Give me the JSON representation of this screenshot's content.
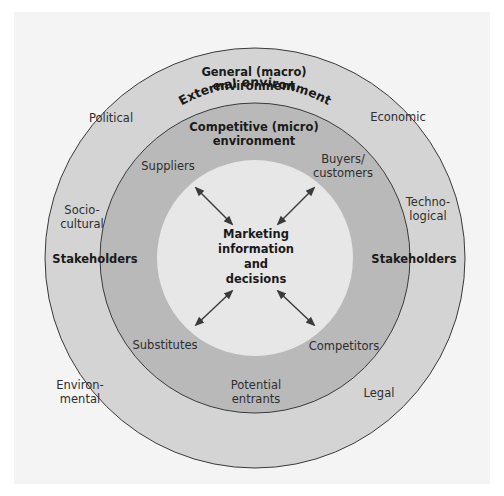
{
  "diagram": {
    "colors": {
      "background": "#ffffff",
      "panel": "#f4f4f4",
      "outer_ring": "#d4d4d4",
      "inner_ring": "#b9b9b9",
      "center": "#e7e7e7",
      "stroke": "#3a3a3a",
      "text": "#2e2e2e"
    },
    "outer_title": "External   environment",
    "general": {
      "title_line1": "General (macro)",
      "title_line2": "environment",
      "factors": {
        "political": "Political",
        "economic": "Economic",
        "socio_line1": "Socio-",
        "socio_line2": "cultural",
        "techno_line1": "Techno-",
        "techno_line2": "logical",
        "environ_line1": "Environ-",
        "environ_line2": "mental",
        "legal": "Legal"
      }
    },
    "competitive": {
      "title_line1": "Competitive (micro)",
      "title_line2": "environment",
      "forces": {
        "suppliers": "Suppliers",
        "buyers_line1": "Buyers/",
        "buyers_line2": "customers",
        "substitutes": "Substitutes",
        "competitors": "Competitors",
        "entrants_line1": "Potential",
        "entrants_line2": "entrants"
      }
    },
    "stakeholders_left": "Stakeholders",
    "stakeholders_right": "Stakeholders",
    "center": {
      "line1": "Marketing",
      "line2": "information",
      "line3": "and",
      "line4": "decisions"
    },
    "arrows": [
      "double-arrow-top-left",
      "double-arrow-top-right",
      "double-arrow-bottom-left",
      "double-arrow-bottom-right"
    ]
  }
}
